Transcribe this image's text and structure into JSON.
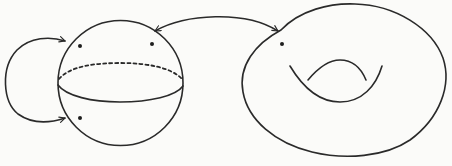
{
  "diagram": {
    "description": "Sphere with three marked points and gluing arrows mapped to a torus with one marked point",
    "colors": {
      "background": "#fbfbf9",
      "stroke": "#2a2a2a",
      "dot": "#1e1e1e"
    },
    "sphere": {
      "label": "sphere",
      "center": [
        120,
        83
      ],
      "radius": 62,
      "equator": {
        "front": "solid",
        "back": "dashed"
      },
      "marked_points": [
        {
          "name": "upper-left point",
          "x": 80,
          "y": 46
        },
        {
          "name": "upper-right point",
          "x": 152,
          "y": 44
        },
        {
          "name": "lower-left point",
          "x": 80,
          "y": 118
        }
      ]
    },
    "torus": {
      "label": "torus",
      "genus": 1,
      "marked_points": [
        {
          "name": "torus point",
          "x": 282,
          "y": 44
        }
      ]
    },
    "arrows": [
      {
        "name": "self-gluing loop",
        "from": "upper-left of sphere",
        "to": "lower-left of sphere",
        "heads": 2
      },
      {
        "name": "sphere-to-torus map",
        "from": "sphere upper-right",
        "to": "torus upper-left",
        "heads": 2
      }
    ]
  }
}
